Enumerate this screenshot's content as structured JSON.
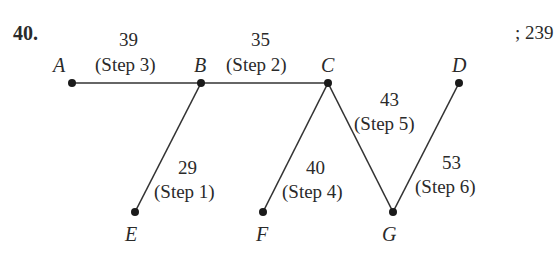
{
  "problem": {
    "number": "40.",
    "answer": "; 239"
  },
  "nodes": [
    {
      "id": "A",
      "label": "A"
    },
    {
      "id": "B",
      "label": "B"
    },
    {
      "id": "C",
      "label": "C"
    },
    {
      "id": "D",
      "label": "D"
    },
    {
      "id": "E",
      "label": "E"
    },
    {
      "id": "F",
      "label": "F"
    },
    {
      "id": "G",
      "label": "G"
    }
  ],
  "edges": [
    {
      "from": "A",
      "to": "B",
      "weight": "39",
      "step": "(Step 3)"
    },
    {
      "from": "B",
      "to": "C",
      "weight": "35",
      "step": "(Step 2)"
    },
    {
      "from": "B",
      "to": "E",
      "weight": "29",
      "step": "(Step 1)"
    },
    {
      "from": "C",
      "to": "F",
      "weight": "40",
      "step": "(Step 4)"
    },
    {
      "from": "C",
      "to": "G",
      "weight": "43",
      "step": "(Step 5)"
    },
    {
      "from": "G",
      "to": "D",
      "weight": "53",
      "step": "(Step 6)"
    }
  ]
}
